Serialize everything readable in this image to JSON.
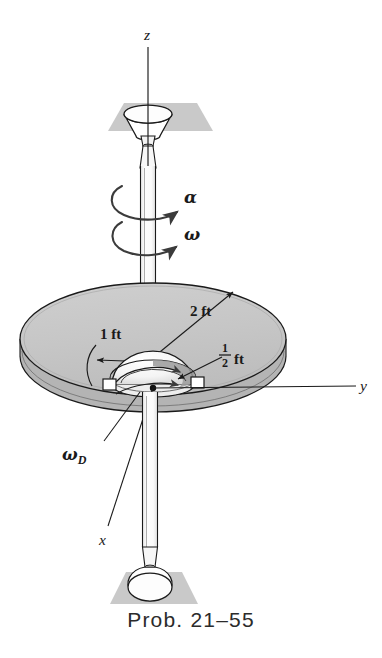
{
  "figure": {
    "caption": "Prob. 21–55",
    "colors": {
      "disk_fill": "#c6c6c6",
      "disk_edge_fill": "#b4b4b4",
      "support_plate_fill": "#c9c9c9",
      "line": "#1a1a1a",
      "shaft_fill": "#fbfbfb",
      "dome_fill": "#f2f2f2",
      "dome_shade": "#9b9b9b",
      "text": "#1a1a1a",
      "caption_text": "#2b2b2b",
      "background": "#ffffff"
    }
  },
  "axes": [
    {
      "name": "z-axis",
      "label": "z"
    },
    {
      "name": "y-axis",
      "label": "y"
    },
    {
      "name": "x-axis",
      "label": "x"
    }
  ],
  "labels": {
    "alpha": "α",
    "omega": "ω",
    "omega_d_symbol": "ω",
    "omega_d_subscript": "D",
    "point_a": "A",
    "dim_outer_radius": "2 ft",
    "dim_inner_radius": "1 ft",
    "dim_dome_radius_numerator": "1",
    "dim_dome_radius_denominator": "2",
    "dim_dome_radius_unit": "ft"
  },
  "dimensions": [
    {
      "name": "outer-disk-radius",
      "value": "2 ft",
      "numeric": 2,
      "unit": "ft"
    },
    {
      "name": "inner-radius",
      "value": "1 ft",
      "numeric": 1,
      "unit": "ft"
    },
    {
      "name": "dome-radius",
      "value": "1/2 ft",
      "numeric": 0.5,
      "unit": "ft"
    }
  ],
  "components": [
    {
      "name": "top-support-plate",
      "kind": "plate"
    },
    {
      "name": "top-bearing-cup",
      "kind": "bearing"
    },
    {
      "name": "vertical-shaft",
      "kind": "shaft"
    },
    {
      "name": "main-disk",
      "kind": "disk"
    },
    {
      "name": "hemisphere-dome",
      "kind": "dome"
    },
    {
      "name": "bearing-block-left",
      "kind": "block"
    },
    {
      "name": "bearing-block-right",
      "kind": "block"
    },
    {
      "name": "bottom-support-plate",
      "kind": "plate"
    },
    {
      "name": "bottom-bearing-cup",
      "kind": "bearing"
    }
  ]
}
